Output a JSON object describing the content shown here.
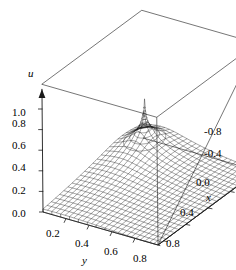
{
  "figure": {
    "type": "surface-plot-3d",
    "background_color": "#ffffff",
    "line_color": "#1a1a1a",
    "width": 236,
    "height": 270
  },
  "axes": {
    "u": {
      "name": "u",
      "ticks": [
        "0.0",
        "0.2",
        "0.4",
        "0.6",
        "0.8",
        "1.0"
      ],
      "values": [
        0.0,
        0.2,
        0.4,
        0.6,
        0.8,
        1.0
      ],
      "range": [
        0.0,
        1.0
      ],
      "has_arrow": true
    },
    "x": {
      "name": "x",
      "ticks": [
        "-0.8",
        "-0.4",
        "0.0",
        "0.4",
        "0.8"
      ],
      "values": [
        -0.8,
        -0.4,
        0.0,
        0.4,
        0.8
      ],
      "range": [
        -1.0,
        1.0
      ],
      "has_arrow": false
    },
    "y": {
      "name": "y",
      "ticks": [
        "0.2",
        "0.4",
        "0.6",
        "0.8"
      ],
      "values": [
        0.2,
        0.4,
        0.6,
        0.8
      ],
      "range": [
        0.0,
        1.0
      ],
      "has_arrow": false
    }
  },
  "chart_data": {
    "type": "surface",
    "title": "",
    "xlabel": "x",
    "ylabel": "y",
    "zlabel": "u",
    "xlim": [
      -1.0,
      1.0
    ],
    "ylim": [
      0.0,
      1.0
    ],
    "zlim": [
      0.0,
      1.0
    ],
    "grid": false,
    "legend": false,
    "mesh": {
      "u_lines": 24,
      "v_lines": 26,
      "style": "wireframe"
    },
    "features": [
      "single sharp peak (singularity) near the back-left of the domain",
      "surface falls steeply to a rounded bowl toward the front",
      "mesh lines converge and darken at the peak",
      "vertical drop lines from the surface boundary to the base plane",
      "open wireframe bounding box drawn behind the surface"
    ],
    "peak": {
      "x": -0.62,
      "y": 0.2,
      "u": 1.0
    }
  }
}
